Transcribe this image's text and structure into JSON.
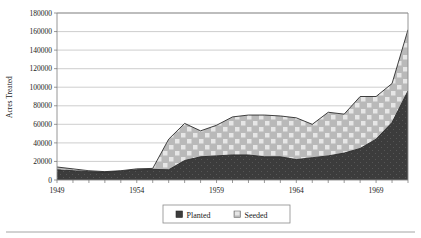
{
  "chart_data": {
    "type": "area",
    "stacked": true,
    "title": "",
    "xlabel": "",
    "ylabel": "Acres Treated",
    "ylim": [
      0,
      180000
    ],
    "ytick_step": 20000,
    "ytick_labels": [
      "0",
      "20000",
      "40000",
      "60000",
      "80000",
      "100000",
      "120000",
      "140000",
      "160000",
      "180000"
    ],
    "ytick_values": [
      0,
      20000,
      40000,
      60000,
      80000,
      100000,
      120000,
      140000,
      160000,
      180000
    ],
    "xtick_labels": [
      "1949",
      "1954",
      "1959",
      "1964",
      "1969"
    ],
    "xtick_values": [
      1949,
      1954,
      1959,
      1964,
      1969
    ],
    "xlim": [
      1949,
      1971
    ],
    "grid": true,
    "grid_axis": "y",
    "legend_position": "bottom-center",
    "x": [
      1949,
      1950,
      1951,
      1952,
      1953,
      1954,
      1955,
      1956,
      1957,
      1958,
      1959,
      1960,
      1961,
      1962,
      1963,
      1964,
      1965,
      1966,
      1967,
      1968,
      1969,
      1970,
      1971
    ],
    "series": [
      {
        "name": "Planted",
        "color": "#3b3b3b",
        "values": [
          11000,
          10000,
          9000,
          8500,
          9500,
          11000,
          11500,
          11000,
          21000,
          25000,
          26000,
          27000,
          27000,
          25000,
          25000,
          22000,
          24000,
          26000,
          29000,
          34000,
          44000,
          62000,
          96000
        ]
      },
      {
        "name": "Seeded",
        "color": "#b8b8b8",
        "values": [
          3000,
          2000,
          1000,
          500,
          500,
          1000,
          1000,
          33000,
          40000,
          28000,
          33000,
          41000,
          43000,
          45000,
          44000,
          45000,
          36000,
          47000,
          42000,
          56000,
          46000,
          42000,
          66000
        ]
      }
    ],
    "totals": [
      14000,
      12000,
      10000,
      9000,
      10000,
      12000,
      12500,
      44000,
      61000,
      53000,
      59000,
      68000,
      70000,
      70000,
      69000,
      67000,
      60000,
      73000,
      71000,
      90000,
      90000,
      104000,
      162000
    ]
  },
  "legend": {
    "items": [
      {
        "label": "Planted",
        "swatch": "dark-solid"
      },
      {
        "label": "Seeded",
        "swatch": "light-checkered"
      }
    ]
  },
  "axes": {
    "y_title": "Acres Treated"
  }
}
